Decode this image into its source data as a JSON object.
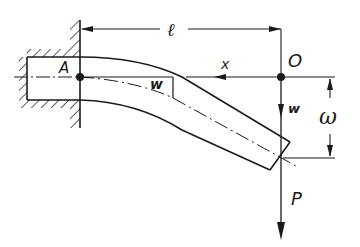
{
  "diagram": {
    "type": "cantilever-beam-deflection",
    "colors": {
      "ink": "#1a1a1a",
      "background": "#ffffff"
    },
    "labels": {
      "length": "ℓ",
      "origin": "O",
      "axis_x": "x",
      "deflection_w_at_origin": "w",
      "deflection_w_local": "w",
      "tip_deflection": "ω",
      "load": "P",
      "point_A": "A"
    },
    "elements": [
      "clamped-wall-support",
      "bent-cantilever-beam",
      "beam-centerline",
      "length-dimension",
      "x-axis-arrow",
      "w-axis-arrow",
      "tip-deflection-dimension",
      "load-arrow-P",
      "point-A",
      "origin-O"
    ]
  }
}
